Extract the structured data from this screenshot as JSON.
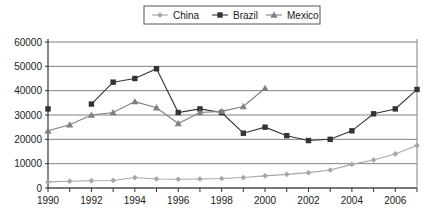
{
  "chart_data": {
    "type": "line",
    "title": "",
    "subtitle": "",
    "xlabel": "",
    "ylabel": "",
    "xlim": [
      1990,
      2007
    ],
    "ylim": [
      0,
      60000
    ],
    "ytick_step": 10000,
    "yticks": [
      "0",
      "10000",
      "20000",
      "30000",
      "40000",
      "50000",
      "60000"
    ],
    "xticks_all": [
      1990,
      1991,
      1992,
      1993,
      1994,
      1995,
      1996,
      1997,
      1998,
      1999,
      2000,
      2001,
      2002,
      2003,
      2004,
      2005,
      2006,
      2007
    ],
    "xtick_labels": [
      "1990",
      "1992",
      "1994",
      "1996",
      "1998",
      "2000",
      "2002",
      "2004",
      "2006"
    ],
    "xtick_label_years": [
      1990,
      1992,
      1994,
      1996,
      1998,
      2000,
      2002,
      2004,
      2006
    ],
    "grid": "horizontal",
    "legend_position": "top-center",
    "legend_border": true,
    "x": [
      1990,
      1991,
      1992,
      1993,
      1994,
      1995,
      1996,
      1997,
      1998,
      1999,
      2000,
      2001,
      2002,
      2003,
      2004,
      2005,
      2006,
      2007
    ],
    "series": [
      {
        "name": "China",
        "marker": "diamond",
        "color": "#a6a6a6",
        "line_color": "#a6a6a6",
        "values": [
          2500,
          2800,
          3000,
          3100,
          4300,
          3700,
          3600,
          3700,
          3900,
          4300,
          5000,
          5600,
          6300,
          7400,
          9700,
          11500,
          14000,
          17500
        ]
      },
      {
        "name": "Brazil",
        "marker": "square",
        "color": "#333333",
        "line_color": "#333333",
        "values": [
          32500,
          null,
          34500,
          43500,
          45000,
          49000,
          31000,
          32500,
          31000,
          22500,
          25000,
          21500,
          19500,
          20000,
          23500,
          30500,
          32500,
          40500
        ]
      },
      {
        "name": "Mexico",
        "marker": "triangle",
        "color": "#808080",
        "line_color": "#808080",
        "values": [
          23500,
          26000,
          30000,
          31000,
          35500,
          33000,
          26500,
          31000,
          31500,
          33500,
          41000,
          null,
          null,
          null,
          null,
          null,
          null,
          null
        ]
      }
    ]
  },
  "legend": {
    "items": [
      {
        "label": "China"
      },
      {
        "label": "Brazil"
      },
      {
        "label": "Mexico"
      }
    ]
  }
}
